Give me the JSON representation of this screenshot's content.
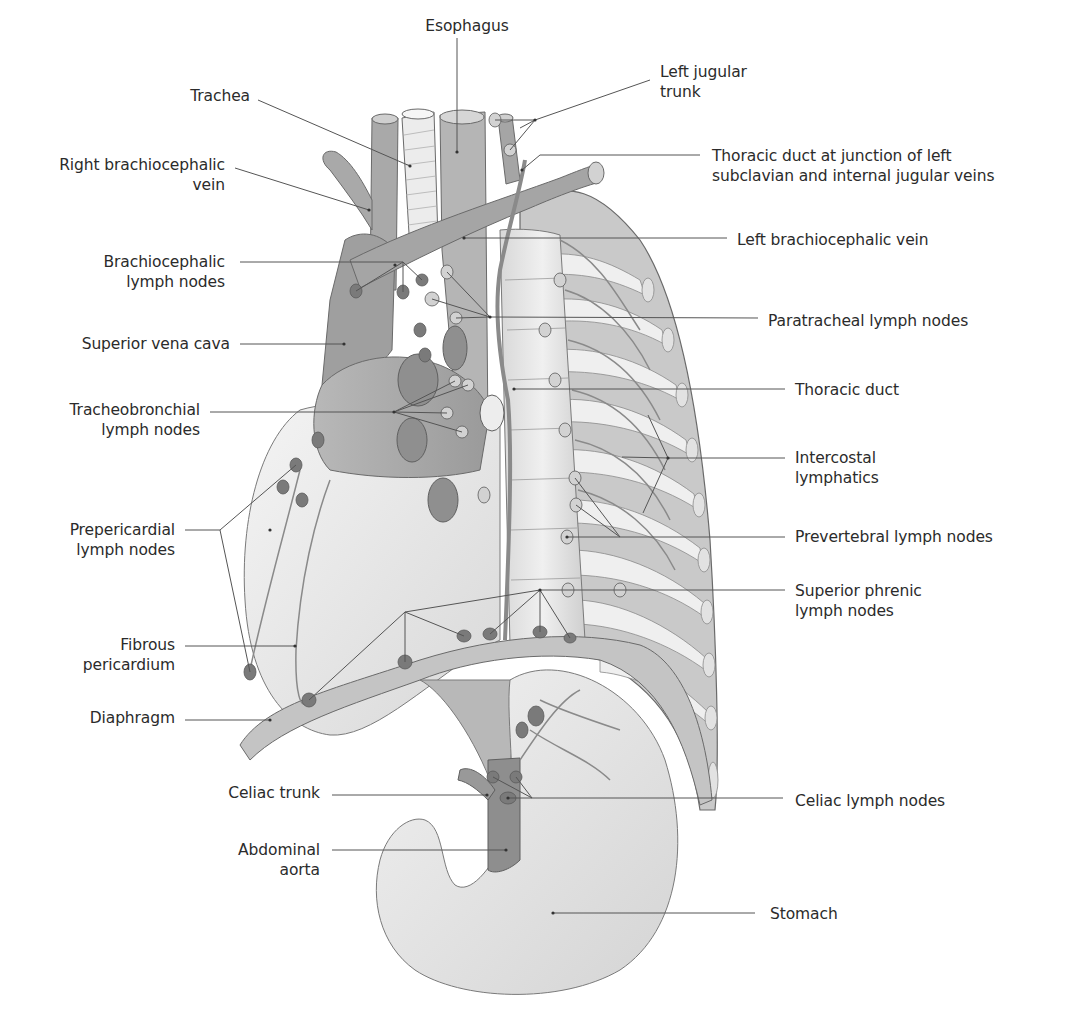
{
  "figure": {
    "type": "anatomical-illustration",
    "colors": {
      "background": "#ffffff",
      "label_text": "#2b2b2b",
      "leader_line": "#555555",
      "organ_light": "#e6e6e6",
      "organ_mid": "#bdbdbd",
      "organ_dark": "#8e8e8e",
      "lymph_node": "#7a7a7a",
      "outline": "#6a6a6a"
    }
  },
  "labels": [
    {
      "id": "esophagus",
      "text": "Esophagus",
      "x": 412,
      "y": 16,
      "w": 110,
      "align": "center",
      "anchor": [
        457,
        152
      ]
    },
    {
      "id": "left-jugular-trunk",
      "text": "Left jugular\ntrunk",
      "x": 660,
      "y": 62,
      "w": 120,
      "align": "left",
      "anchor": [
        535,
        120
      ]
    },
    {
      "id": "trachea",
      "text": "Trachea",
      "x": 150,
      "y": 86,
      "w": 100,
      "align": "right",
      "anchor": [
        410,
        166
      ]
    },
    {
      "id": "thoracic-duct-junction",
      "text": "Thoracic duct at junction of left\nsubclavian and internal jugular veins",
      "x": 712,
      "y": 146,
      "w": 360,
      "align": "left",
      "anchor": [
        522,
        170
      ]
    },
    {
      "id": "right-brachiocephalic-vein",
      "text": "Right brachiocephalic\nvein",
      "x": 20,
      "y": 155,
      "w": 205,
      "align": "right",
      "anchor": [
        369,
        210
      ]
    },
    {
      "id": "left-brachiocephalic-vein",
      "text": "Left brachiocephalic vein",
      "x": 737,
      "y": 230,
      "w": 260,
      "align": "left",
      "anchor": [
        464,
        238
      ]
    },
    {
      "id": "brachiocephalic-lymph-nodes",
      "text": "Brachiocephalic\nlymph nodes",
      "x": 60,
      "y": 252,
      "w": 165,
      "align": "right",
      "anchor": [
        395,
        265
      ]
    },
    {
      "id": "paratracheal-lymph-nodes",
      "text": "Paratracheal lymph nodes",
      "x": 768,
      "y": 311,
      "w": 260,
      "align": "left",
      "anchor": [
        490,
        317
      ]
    },
    {
      "id": "superior-vena-cava",
      "text": "Superior vena cava",
      "x": 40,
      "y": 334,
      "w": 190,
      "align": "right",
      "anchor": [
        344,
        344
      ]
    },
    {
      "id": "thoracic-duct",
      "text": "Thoracic duct",
      "x": 795,
      "y": 380,
      "w": 200,
      "align": "left",
      "anchor": [
        514,
        389
      ]
    },
    {
      "id": "tracheobronchial-lymph-nodes",
      "text": "Tracheobronchial\nlymph nodes",
      "x": 40,
      "y": 400,
      "w": 160,
      "align": "right",
      "anchor": [
        394,
        412
      ]
    },
    {
      "id": "intercostal-lymphatics",
      "text": "Intercostal\nlymphatics",
      "x": 795,
      "y": 448,
      "w": 160,
      "align": "left",
      "anchor": [
        668,
        458
      ]
    },
    {
      "id": "prepericardial-lymph-nodes",
      "text": "Prepericardial\nlymph nodes",
      "x": 40,
      "y": 520,
      "w": 135,
      "align": "right",
      "anchor": [
        270,
        530
      ]
    },
    {
      "id": "prevertebral-lymph-nodes",
      "text": "Prevertebral lymph nodes",
      "x": 795,
      "y": 527,
      "w": 260,
      "align": "left",
      "anchor": [
        567,
        537
      ]
    },
    {
      "id": "superior-phrenic-lymph-nodes",
      "text": "Superior phrenic\nlymph nodes",
      "x": 795,
      "y": 581,
      "w": 200,
      "align": "left",
      "anchor": [
        540,
        590
      ]
    },
    {
      "id": "fibrous-pericardium",
      "text": "Fibrous\npericardium",
      "x": 40,
      "y": 635,
      "w": 135,
      "align": "right",
      "anchor": [
        295,
        646
      ]
    },
    {
      "id": "diaphragm",
      "text": "Diaphragm",
      "x": 40,
      "y": 708,
      "w": 135,
      "align": "right",
      "anchor": [
        270,
        720
      ]
    },
    {
      "id": "celiac-trunk",
      "text": "Celiac trunk",
      "x": 150,
      "y": 783,
      "w": 170,
      "align": "right",
      "anchor": [
        487,
        795
      ]
    },
    {
      "id": "celiac-lymph-nodes",
      "text": "Celiac lymph nodes",
      "x": 795,
      "y": 791,
      "w": 220,
      "align": "left",
      "anchor": [
        508,
        798
      ]
    },
    {
      "id": "abdominal-aorta",
      "text": "Abdominal\naorta",
      "x": 150,
      "y": 840,
      "w": 170,
      "align": "right",
      "anchor": [
        506,
        850
      ]
    },
    {
      "id": "stomach",
      "text": "Stomach",
      "x": 770,
      "y": 904,
      "w": 120,
      "align": "left",
      "anchor": [
        553,
        913
      ]
    }
  ],
  "leader_lines": [
    {
      "id": "esophagus",
      "points": [
        [
          457,
          38
        ],
        [
          457,
          152
        ]
      ]
    },
    {
      "id": "left-jugular-trunk",
      "points": [
        [
          650,
          80
        ],
        [
          535,
          120
        ]
      ],
      "branches": [
        [
          [
            535,
            120
          ],
          [
            495,
            120
          ]
        ],
        [
          [
            535,
            120
          ],
          [
            510,
            150
          ]
        ],
        [
          [
            535,
            120
          ],
          [
            520,
            128
          ]
        ]
      ]
    },
    {
      "id": "trachea",
      "points": [
        [
          258,
          100
        ],
        [
          410,
          166
        ]
      ]
    },
    {
      "id": "thoracic-duct-junction",
      "points": [
        [
          700,
          155
        ],
        [
          540,
          155
        ],
        [
          522,
          170
        ]
      ]
    },
    {
      "id": "right-brachiocephalic-vein",
      "points": [
        [
          235,
          168
        ],
        [
          369,
          210
        ]
      ]
    },
    {
      "id": "left-brachiocephalic-vein",
      "points": [
        [
          727,
          238
        ],
        [
          464,
          238
        ]
      ]
    },
    {
      "id": "brachiocephalic-lymph-nodes",
      "points": [
        [
          240,
          262
        ],
        [
          403,
          262
        ]
      ],
      "branches": [
        [
          [
            403,
            262
          ],
          [
            356,
            291
          ]
        ],
        [
          [
            403,
            262
          ],
          [
            403,
            292
          ]
        ],
        [
          [
            403,
            262
          ],
          [
            422,
            280
          ]
        ]
      ]
    },
    {
      "id": "paratracheal-lymph-nodes",
      "points": [
        [
          758,
          318
        ],
        [
          490,
          317
        ]
      ],
      "branches": [
        [
          [
            490,
            317
          ],
          [
            447,
            272
          ]
        ],
        [
          [
            490,
            317
          ],
          [
            432,
            299
          ]
        ],
        [
          [
            490,
            317
          ],
          [
            456,
            318
          ]
        ]
      ]
    },
    {
      "id": "superior-vena-cava",
      "points": [
        [
          240,
          344
        ],
        [
          344,
          344
        ]
      ]
    },
    {
      "id": "thoracic-duct",
      "points": [
        [
          785,
          389
        ],
        [
          514,
          389
        ]
      ]
    },
    {
      "id": "tracheobronchial-lymph-nodes",
      "points": [
        [
          210,
          412
        ],
        [
          394,
          412
        ]
      ],
      "branches": [
        [
          [
            394,
            412
          ],
          [
            455,
            381
          ]
        ],
        [
          [
            394,
            412
          ],
          [
            468,
            385
          ]
        ],
        [
          [
            394,
            412
          ],
          [
            447,
            413
          ]
        ],
        [
          [
            394,
            412
          ],
          [
            462,
            432
          ]
        ]
      ]
    },
    {
      "id": "intercostal-lymphatics",
      "points": [
        [
          785,
          458
        ],
        [
          668,
          458
        ]
      ],
      "branches": [
        [
          [
            668,
            458
          ],
          [
            648,
            415
          ]
        ],
        [
          [
            668,
            458
          ],
          [
            622,
            457
          ]
        ],
        [
          [
            668,
            458
          ],
          [
            643,
            513
          ]
        ]
      ]
    },
    {
      "id": "prepericardial-lymph-nodes",
      "points": [
        [
          185,
          530
        ],
        [
          220,
          530
        ]
      ],
      "branches": [
        [
          [
            220,
            530
          ],
          [
            296,
            465
          ]
        ],
        [
          [
            220,
            530
          ],
          [
            250,
            672
          ]
        ]
      ]
    },
    {
      "id": "prevertebral-lymph-nodes",
      "points": [
        [
          785,
          537
        ],
        [
          567,
          537
        ]
      ],
      "branches": [
        [
          [
            620,
            537
          ],
          [
            575,
            478
          ]
        ],
        [
          [
            620,
            537
          ],
          [
            576,
            505
          ]
        ]
      ]
    },
    {
      "id": "superior-phrenic-lymph-nodes",
      "points": [
        [
          785,
          590
        ],
        [
          540,
          590
        ]
      ],
      "branches": [
        [
          [
            540,
            590
          ],
          [
            490,
            634
          ]
        ],
        [
          [
            540,
            590
          ],
          [
            540,
            632
          ]
        ],
        [
          [
            540,
            590
          ],
          [
            570,
            638
          ]
        ],
        [
          [
            405,
            612
          ],
          [
            540,
            590
          ]
        ],
        [
          [
            405,
            612
          ],
          [
            405,
            662
          ]
        ],
        [
          [
            405,
            612
          ],
          [
            464,
            636
          ]
        ],
        [
          [
            405,
            612
          ],
          [
            309,
            700
          ]
        ]
      ]
    },
    {
      "id": "fibrous-pericardium",
      "points": [
        [
          185,
          646
        ],
        [
          295,
          646
        ]
      ]
    },
    {
      "id": "diaphragm",
      "points": [
        [
          185,
          720
        ],
        [
          270,
          720
        ]
      ]
    },
    {
      "id": "celiac-trunk",
      "points": [
        [
          332,
          795
        ],
        [
          487,
          795
        ]
      ]
    },
    {
      "id": "celiac-lymph-nodes",
      "points": [
        [
          783,
          798
        ],
        [
          508,
          798
        ]
      ],
      "branches": [
        [
          [
            532,
            798
          ],
          [
            493,
            777
          ]
        ],
        [
          [
            532,
            798
          ],
          [
            516,
            777
          ]
        ]
      ]
    },
    {
      "id": "abdominal-aorta",
      "points": [
        [
          332,
          850
        ],
        [
          506,
          850
        ]
      ]
    },
    {
      "id": "stomach",
      "points": [
        [
          755,
          913
        ],
        [
          553,
          913
        ]
      ]
    }
  ]
}
